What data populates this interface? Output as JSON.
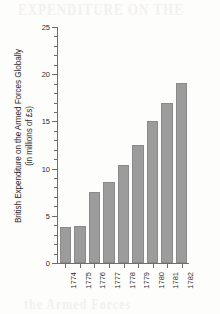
{
  "page": {
    "background_color": "#fdfdfc",
    "ghost_artifact_top": "EXPENDITURE ON THE",
    "ghost_artifact_bottom": "the Armed Forces"
  },
  "chart_data": {
    "type": "bar",
    "title": "",
    "xlabel": "",
    "ylabel": "British Expenditure on the Armed Forces Globally (in millions of £s)",
    "ylabel_line1": "British Expenditure on the Armed Forces Globally",
    "ylabel_line2": "(in millions of £s)",
    "categories": [
      "1774",
      "1775",
      "1776",
      "1777",
      "1778",
      "1779",
      "1780",
      "1781",
      "1782"
    ],
    "values": [
      3.8,
      3.9,
      7.5,
      8.6,
      10.4,
      12.5,
      15.0,
      17.0,
      19.1
    ],
    "ylim": [
      0,
      25
    ],
    "y_major_ticks": [
      "0",
      "5",
      "10",
      "15",
      "20",
      "25"
    ],
    "y_minor_tick_interval": 1,
    "grid": false,
    "legend": false,
    "legend_position": "none",
    "bar_color": "#9c9c9c",
    "bar_border_color": "#8a8a8a",
    "axis_color": "#6d6d6d",
    "text_color": "#2c2c2c",
    "x_tick_label_rotation": -90
  }
}
